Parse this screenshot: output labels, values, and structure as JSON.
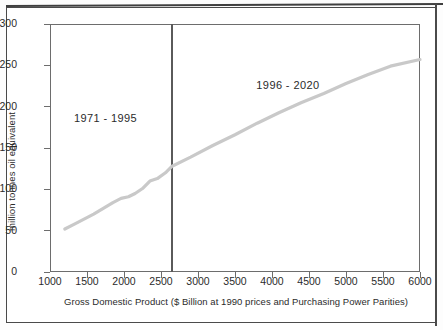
{
  "page": {
    "clipped_title_fragment": "",
    "background_color": "#ffffff",
    "frame_color": "#4a4a4a"
  },
  "chart_data": {
    "type": "line",
    "title": "",
    "xlabel": "Gross Domestic Product ($ Billion at 1990 prices and Purchasing Power Parities)",
    "ylabel": "million tonnes oil equivalent",
    "xlim": [
      1000,
      6000
    ],
    "ylim": [
      0,
      300
    ],
    "xticks": [
      1000,
      1500,
      2000,
      2500,
      3000,
      3500,
      4000,
      4500,
      5000,
      5500,
      6000
    ],
    "yticks": [
      0,
      50,
      100,
      150,
      200,
      250,
      300
    ],
    "xtick_labels": [
      "1000",
      "1500",
      "2000",
      "2500",
      "3000",
      "3500",
      "4000",
      "4500",
      "5000",
      "5500",
      "6000"
    ],
    "ytick_labels": [
      "0",
      "50",
      "100",
      "150",
      "200",
      "250",
      "300"
    ],
    "grid": false,
    "legend": "none",
    "line_color": "#c9c9c9",
    "line_width": 3.2,
    "axis_color": "#6d6d6d",
    "divider": {
      "x_value": 2650,
      "color": "#5a5a5a",
      "label": "boundary between historical data and projection"
    },
    "annotations": [
      {
        "text": "1971 - 1995",
        "x_value": 1810,
        "y_value": 185
      },
      {
        "text": "1996 - 2020",
        "x_value": 4275,
        "y_value": 225
      }
    ],
    "series": [
      {
        "name": "Energy consumption vs GDP",
        "x": [
          1200,
          1330,
          1460,
          1590,
          1720,
          1850,
          1960,
          2060,
          2150,
          2250,
          2350,
          2450,
          2560,
          2650,
          2900,
          3200,
          3500,
          3800,
          4100,
          4400,
          4700,
          5000,
          5300,
          5600,
          6000
        ],
        "values": [
          52,
          58,
          64,
          70,
          77,
          84,
          89,
          91,
          95,
          101,
          110,
          113,
          120,
          128,
          139,
          153,
          166,
          180,
          193,
          205,
          216,
          228,
          239,
          249,
          257
        ]
      }
    ]
  }
}
